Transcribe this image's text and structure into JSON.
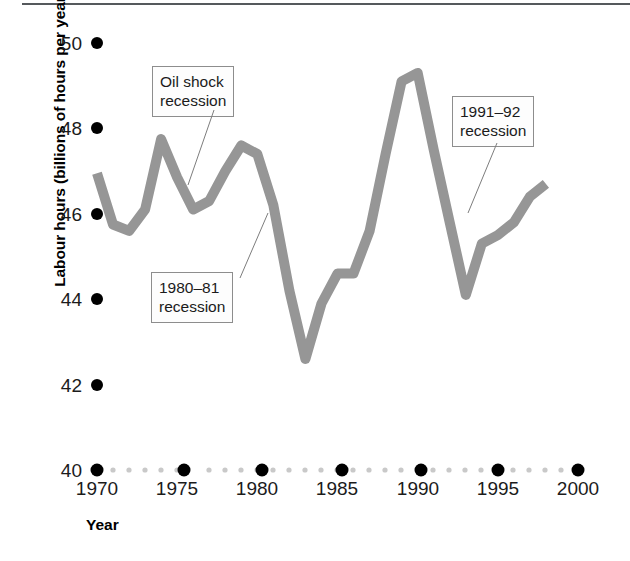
{
  "figure": {
    "type": "line-chart-figure",
    "background_color": "#ffffff",
    "line_color": "#969696",
    "tick_dot_color": "#000000",
    "minor_dot_color": "#c9c9c9"
  },
  "axes": {
    "y_axis_title": "Labour hours (billions of hours per year)",
    "x_axis_title": "Year",
    "y_ticks": [
      "50",
      "48",
      "46",
      "44",
      "42",
      "40"
    ],
    "x_ticks": [
      "1970",
      "1975",
      "1980",
      "1985",
      "1990",
      "1995",
      "2000"
    ]
  },
  "annotations": [
    {
      "name": "oil-shock-recession",
      "line1": "Oil shock",
      "line2": "recession"
    },
    {
      "name": "1980-81-recession",
      "line1": "1980–81",
      "line2": "recession"
    },
    {
      "name": "1991-92-recession",
      "line1": "1991–92",
      "line2": "recession"
    }
  ],
  "chart_data": {
    "type": "line",
    "title": "",
    "subtitle": "",
    "xlabel": "Year",
    "ylabel": "Labour hours (billions of hours per year)",
    "xlim": [
      1970,
      2000
    ],
    "ylim": [
      40,
      50
    ],
    "grid": false,
    "legend": null,
    "xticks": [
      1970,
      1975,
      1980,
      1985,
      1990,
      1995,
      2000
    ],
    "yticks": [
      40,
      42,
      44,
      46,
      48,
      50
    ],
    "series": [
      {
        "name": "Labour hours",
        "color": "#969696",
        "x": [
          1970,
          1971,
          1972,
          1973,
          1974,
          1975,
          1976,
          1977,
          1978,
          1979,
          1980,
          1981,
          1982,
          1983,
          1984,
          1985,
          1986,
          1987,
          1988,
          1989,
          1990,
          1991,
          1992,
          1993,
          1994,
          1995,
          1996,
          1997,
          1998
        ],
        "y": [
          46.95,
          45.75,
          45.6,
          46.1,
          47.75,
          46.85,
          46.1,
          46.3,
          47.0,
          47.6,
          47.4,
          46.2,
          44.2,
          42.6,
          43.9,
          44.6,
          44.6,
          45.6,
          47.4,
          49.1,
          49.3,
          47.5,
          45.8,
          44.1,
          45.3,
          45.5,
          45.8,
          46.4,
          46.7
        ]
      }
    ],
    "annotations": [
      {
        "text": "Oil shock recession",
        "points_to_x": 1975,
        "points_to_y": 46.85
      },
      {
        "text": "1980–81 recession",
        "points_to_x": 1981,
        "points_to_y": 46.2
      },
      {
        "text": "1991–92 recession",
        "points_to_x": 1992,
        "points_to_y": 45.8
      }
    ]
  }
}
